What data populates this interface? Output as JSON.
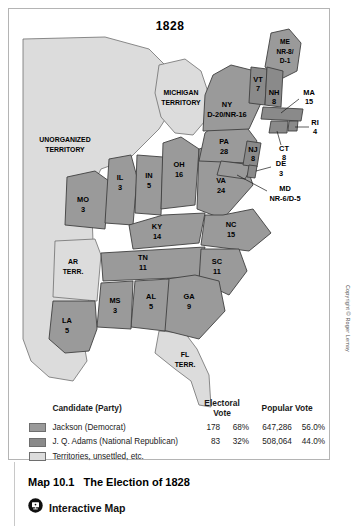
{
  "map": {
    "title": "1828",
    "credit": "Copyright © Roger Lemay",
    "regions": [
      {
        "code": "ME",
        "label": "ME",
        "value": "NR-8/\nD-1",
        "party": "split"
      },
      {
        "code": "VT",
        "label": "VT",
        "value": "7",
        "party": "adams"
      },
      {
        "code": "NH",
        "label": "NH",
        "value": "8",
        "party": "adams"
      },
      {
        "code": "MA",
        "label": "MA",
        "value": "15",
        "party": "adams"
      },
      {
        "code": "RI",
        "label": "RI",
        "value": "4",
        "party": "adams"
      },
      {
        "code": "CT",
        "label": "CT",
        "value": "8",
        "party": "adams"
      },
      {
        "code": "NY",
        "label": "NY",
        "value": "D-20/NR-16",
        "party": "split"
      },
      {
        "code": "PA",
        "label": "PA",
        "value": "28",
        "party": "jackson"
      },
      {
        "code": "NJ",
        "label": "NJ",
        "value": "8",
        "party": "adams"
      },
      {
        "code": "DE",
        "label": "DE",
        "value": "3",
        "party": "adams"
      },
      {
        "code": "MD",
        "label": "MD",
        "value": "NR-6/D-5",
        "party": "split"
      },
      {
        "code": "VA",
        "label": "VA",
        "value": "24",
        "party": "jackson"
      },
      {
        "code": "OH",
        "label": "OH",
        "value": "16",
        "party": "jackson"
      },
      {
        "code": "IN",
        "label": "IN",
        "value": "5",
        "party": "jackson"
      },
      {
        "code": "IL",
        "label": "IL",
        "value": "3",
        "party": "jackson"
      },
      {
        "code": "KY",
        "label": "KY",
        "value": "14",
        "party": "jackson"
      },
      {
        "code": "MO",
        "label": "MO",
        "value": "3",
        "party": "jackson"
      },
      {
        "code": "TN",
        "label": "TN",
        "value": "11",
        "party": "jackson"
      },
      {
        "code": "NC",
        "label": "NC",
        "value": "15",
        "party": "jackson"
      },
      {
        "code": "SC",
        "label": "SC",
        "value": "11",
        "party": "jackson"
      },
      {
        "code": "GA",
        "label": "GA",
        "value": "9",
        "party": "jackson"
      },
      {
        "code": "AL",
        "label": "AL",
        "value": "5",
        "party": "jackson"
      },
      {
        "code": "MS",
        "label": "MS",
        "value": "3",
        "party": "jackson"
      },
      {
        "code": "LA",
        "label": "LA",
        "value": "5",
        "party": "jackson"
      }
    ],
    "territories": [
      {
        "code": "MI",
        "line1": "MICHIGAN",
        "line2": "TERRITORY"
      },
      {
        "code": "UNORG",
        "line1": "UNORGANIZED",
        "line2": "TERRITORY"
      },
      {
        "code": "AR",
        "line1": "AR",
        "line2": "TERR."
      },
      {
        "code": "FL",
        "line1": "FL",
        "line2": "TERR."
      }
    ]
  },
  "legend": {
    "headers": {
      "candidate": "Candidate (Party)",
      "electoral": "Electoral Vote",
      "popular": "Popular Vote"
    },
    "rows": [
      {
        "name": "Jackson (Democrat)",
        "electoral": "178",
        "electoral_pct": "68%",
        "popular": "647,286",
        "popular_pct": "56.0%",
        "color": "#9a9a9a"
      },
      {
        "name": "J. Q. Adams (National Republican)",
        "electoral": "83",
        "electoral_pct": "32%",
        "popular": "508,064",
        "popular_pct": "44.0%",
        "color": "#8a8a8a"
      },
      {
        "name": "Territories, unsettled, etc.",
        "electoral": "",
        "electoral_pct": "",
        "popular": "",
        "popular_pct": "",
        "color": "#dcdcdc"
      }
    ]
  },
  "caption": {
    "number": "Map 10.1",
    "title": "The Election of 1828",
    "interactive_label": "Interactive Map"
  },
  "colors": {
    "jackson": "#9a9a9a",
    "adams": "#8a8a8a",
    "territory": "#dcdcdc",
    "water": "#ffffff",
    "outline": "#4a4a4a"
  }
}
